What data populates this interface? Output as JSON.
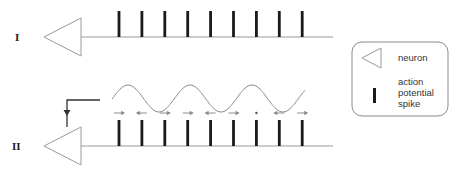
{
  "diagram": {
    "rows": [
      {
        "label": "I",
        "spike_count": 9,
        "has_oscillation": false,
        "has_feedback": false
      },
      {
        "label": "II",
        "spike_count": 9,
        "has_oscillation": true,
        "has_feedback": true,
        "spike_phase_shifts": [
          "right",
          "left",
          "right",
          "right",
          "left",
          "right",
          "none",
          "left",
          "right"
        ]
      }
    ],
    "oscillation_cycles": 3,
    "legend": {
      "items": [
        {
          "symbol": "neuron-triangle",
          "label": "neuron"
        },
        {
          "symbol": "spike-bar",
          "label_lines": [
            "action",
            "potential",
            "spike"
          ]
        }
      ]
    },
    "colors": {
      "axon_line": "#9a9a9a",
      "neuron_outline": "#9a9a9a",
      "spike": "#1a1a1a",
      "wave": "#8c8c8c",
      "phase_arrow": "#8c8c8c",
      "feedback": "#333333",
      "legend_border": "#8c8c8c"
    }
  }
}
